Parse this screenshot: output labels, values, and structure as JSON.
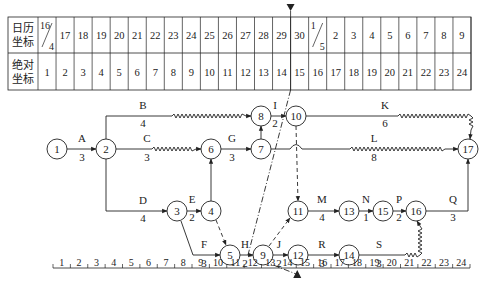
{
  "table": {
    "row1_label": [
      "日历",
      "坐标"
    ],
    "row2_label": [
      "绝对",
      "坐标"
    ],
    "calendar": [
      {
        "top": "16",
        "bottom": "4",
        "split": true
      },
      {
        "v": "17"
      },
      {
        "v": "18"
      },
      {
        "v": "19"
      },
      {
        "v": "20"
      },
      {
        "v": "21"
      },
      {
        "v": "22"
      },
      {
        "v": "23"
      },
      {
        "v": "24"
      },
      {
        "v": "25"
      },
      {
        "v": "26"
      },
      {
        "v": "27"
      },
      {
        "v": "28"
      },
      {
        "v": "29"
      },
      {
        "v": "30"
      },
      {
        "top": "1",
        "bottom": "5",
        "split": true
      },
      {
        "v": "2"
      },
      {
        "v": "3"
      },
      {
        "v": "4"
      },
      {
        "v": "5"
      },
      {
        "v": "6"
      },
      {
        "v": "7"
      },
      {
        "v": "8"
      },
      {
        "v": "9"
      }
    ],
    "absolute": [
      "1",
      "2",
      "3",
      "4",
      "5",
      "6",
      "7",
      "8",
      "9",
      "10",
      "11",
      "12",
      "13",
      "14",
      "15",
      "16",
      "17",
      "18",
      "19",
      "20",
      "21",
      "22",
      "23",
      "24"
    ]
  },
  "check_marker": {
    "column": 14,
    "label_top": "▼",
    "label_bottom": "▲"
  },
  "nodes": [
    {
      "id": "1",
      "x": 57,
      "y": 149
    },
    {
      "id": "2",
      "x": 106,
      "y": 149
    },
    {
      "id": "3",
      "x": 177,
      "y": 211
    },
    {
      "id": "4",
      "x": 211,
      "y": 211
    },
    {
      "id": "5",
      "x": 230,
      "y": 255
    },
    {
      "id": "6",
      "x": 211,
      "y": 149
    },
    {
      "id": "7",
      "x": 261,
      "y": 149
    },
    {
      "id": "8",
      "x": 261,
      "y": 116
    },
    {
      "id": "9",
      "x": 263,
      "y": 255
    },
    {
      "id": "10",
      "x": 296,
      "y": 116
    },
    {
      "id": "11",
      "x": 298,
      "y": 211
    },
    {
      "id": "12",
      "x": 298,
      "y": 255
    },
    {
      "id": "13",
      "x": 349,
      "y": 211
    },
    {
      "id": "14",
      "x": 349,
      "y": 255
    },
    {
      "id": "15",
      "x": 383,
      "y": 211
    },
    {
      "id": "16",
      "x": 416,
      "y": 211
    },
    {
      "id": "17",
      "x": 468,
      "y": 149
    }
  ],
  "activities": [
    {
      "name": "A",
      "duration": "3",
      "from": "1",
      "to": "2",
      "lx": 82,
      "ly": 142,
      "dx": 82,
      "dy": 161
    },
    {
      "name": "B",
      "duration": "4",
      "from": "2",
      "to": "8",
      "lx": 143,
      "ly": 109,
      "dx": 143,
      "dy": 127
    },
    {
      "name": "C",
      "duration": "3",
      "from": "2",
      "to": "6",
      "lx": 147,
      "ly": 142,
      "dx": 147,
      "dy": 161
    },
    {
      "name": "D",
      "duration": "4",
      "from": "2",
      "to": "3",
      "lx": 143,
      "ly": 204,
      "dx": 143,
      "dy": 222
    },
    {
      "name": "E",
      "duration": "2",
      "from": "3",
      "to": "4",
      "lx": 192,
      "ly": 203,
      "dx": 192,
      "dy": 221
    },
    {
      "name": "F",
      "duration": "3",
      "from": "3",
      "to": "5",
      "lx": 204,
      "ly": 248,
      "dx": 204,
      "dy": 267
    },
    {
      "name": "G",
      "duration": "3",
      "from": "6",
      "to": "7",
      "lx": 232,
      "ly": 142,
      "dx": 232,
      "dy": 161
    },
    {
      "name": "H",
      "duration": "2",
      "from": "5",
      "to": "9",
      "lx": 245,
      "ly": 248,
      "dx": 245,
      "dy": 267
    },
    {
      "name": "I",
      "duration": "2",
      "from": "8",
      "to": "10",
      "lx": 275,
      "ly": 109,
      "dx": 275,
      "dy": 127
    },
    {
      "name": "J",
      "duration": "2",
      "from": "9",
      "to": "12",
      "lx": 279,
      "ly": 248,
      "dx": 279,
      "dy": 267
    },
    {
      "name": "K",
      "duration": "6",
      "from": "10",
      "to": "17",
      "lx": 385,
      "ly": 109,
      "dx": 385,
      "dy": 127
    },
    {
      "name": "L",
      "duration": "8",
      "from": "7",
      "to": "17",
      "lx": 374,
      "ly": 142,
      "dx": 374,
      "dy": 161
    },
    {
      "name": "M",
      "duration": "4",
      "from": "11",
      "to": "13",
      "lx": 322,
      "ly": 203,
      "dx": 322,
      "dy": 221
    },
    {
      "name": "N",
      "duration": "1",
      "from": "13",
      "to": "15",
      "lx": 366,
      "ly": 203,
      "dx": 366,
      "dy": 221
    },
    {
      "name": "P",
      "duration": "2",
      "from": "15",
      "to": "16",
      "lx": 399,
      "ly": 203,
      "dx": 399,
      "dy": 221
    },
    {
      "name": "Q",
      "duration": "3",
      "from": "16",
      "to": "17",
      "lx": 453,
      "ly": 203,
      "dx": 453,
      "dy": 221
    },
    {
      "name": "R",
      "duration": "3",
      "from": "12",
      "to": "14",
      "lx": 322,
      "ly": 248,
      "dx": 322,
      "dy": 267
    },
    {
      "name": "S",
      "duration": "3",
      "from": "14",
      "to": "16",
      "lx": 379,
      "ly": 248,
      "dx": 379,
      "dy": 267
    }
  ],
  "ruler": {
    "ticks": [
      "1",
      "2",
      "3",
      "4",
      "5",
      "6",
      "7",
      "8",
      "9",
      "10",
      "11",
      "12",
      "13",
      "14",
      "15",
      "16",
      "17",
      "18",
      "19",
      "20",
      "21",
      "22",
      "23",
      "24"
    ]
  }
}
